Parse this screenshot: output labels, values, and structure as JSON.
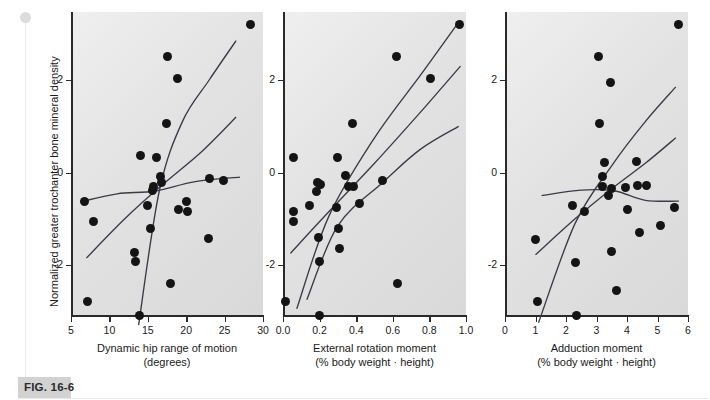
{
  "figure": {
    "caption_label": "FIG. 16-6",
    "shared_ylabel": "Normalized greater trochanter bone mineral density",
    "y_ticks": [
      "2",
      "0",
      "-2"
    ],
    "dot_color": "#141414",
    "curve_color": "#3b3b46",
    "panel_bg": "#e2e2e2"
  },
  "chart_data": [
    {
      "type": "scatter",
      "title": "",
      "xlabel": "Dynamic hip range of motion (degrees)",
      "xlabel_line1": "Dynamic hip range of motion",
      "xlabel_line2": "(degrees)",
      "ylabel": "Normalized greater trochanter bone mineral density",
      "xlim": [
        5,
        30
      ],
      "ylim": [
        -3.6,
        3.4
      ],
      "xticks": [
        5,
        10,
        15,
        20,
        25,
        30
      ],
      "xtick_labels": [
        "5",
        "10",
        "15",
        "20",
        "25",
        "30"
      ],
      "yticks": [
        2,
        0,
        -2
      ],
      "ytick_labels": [
        "2",
        "0",
        "-2"
      ],
      "grid": false,
      "legend": "none",
      "points": [
        [
          6.7,
          -0.62
        ],
        [
          7.1,
          -2.78
        ],
        [
          7.9,
          -1.05
        ],
        [
          13.3,
          -1.72
        ],
        [
          13.4,
          -1.92
        ],
        [
          13.9,
          -3.1
        ],
        [
          14.1,
          0.36
        ],
        [
          14.9,
          -0.72
        ],
        [
          15.3,
          -1.2
        ],
        [
          15.6,
          -0.38
        ],
        [
          15.8,
          -0.3
        ],
        [
          16.1,
          0.33
        ],
        [
          16.6,
          -0.08
        ],
        [
          16.8,
          -0.22
        ],
        [
          17.4,
          1.05
        ],
        [
          17.6,
          2.5
        ],
        [
          18.0,
          -2.4
        ],
        [
          18.9,
          2.04
        ],
        [
          19.0,
          -0.8
        ],
        [
          20.0,
          -0.62
        ],
        [
          20.2,
          -0.85
        ],
        [
          22.9,
          -1.42
        ],
        [
          23.0,
          -0.12
        ],
        [
          24.8,
          -0.18
        ],
        [
          28.4,
          3.2
        ]
      ],
      "curves": {
        "description": "regression fit with upper and lower confidence bands",
        "fit": [
          [
            7.0,
            -1.85
          ],
          [
            12.0,
            -1.0
          ],
          [
            17.0,
            -0.25
          ],
          [
            22.0,
            0.45
          ],
          [
            26.5,
            1.2
          ]
        ],
        "upper": [
          [
            13.8,
            -3.3
          ],
          [
            16.5,
            -0.4
          ],
          [
            19.5,
            1.1
          ],
          [
            23.0,
            2.0
          ],
          [
            26.5,
            2.85
          ]
        ],
        "lower": [
          [
            6.6,
            -0.62
          ],
          [
            11.0,
            -0.46
          ],
          [
            16.0,
            -0.4
          ],
          [
            21.0,
            -0.2
          ],
          [
            27.0,
            -0.1
          ]
        ]
      }
    },
    {
      "type": "scatter",
      "title": "",
      "xlabel": "External rotation moment (% body weight · height)",
      "xlabel_line1": "External rotation moment",
      "xlabel_line2": "(% body weight · height)",
      "ylabel": "Normalized greater trochanter bone mineral density",
      "xlim": [
        0.0,
        1.0
      ],
      "ylim": [
        -3.6,
        3.4
      ],
      "xticks": [
        0.0,
        0.2,
        0.4,
        0.6,
        0.8,
        1.0
      ],
      "xtick_labels": [
        "0.0",
        "0.2",
        "0.4",
        "0.6",
        "0.8",
        "1.0"
      ],
      "yticks": [
        2,
        0,
        -2
      ],
      "ytick_labels": [
        "2",
        "0",
        "-2"
      ],
      "grid": false,
      "legend": "none",
      "points": [
        [
          0.015,
          -2.78
        ],
        [
          0.055,
          0.32
        ],
        [
          0.06,
          -0.85
        ],
        [
          0.06,
          -1.05
        ],
        [
          0.145,
          -0.72
        ],
        [
          0.185,
          -0.42
        ],
        [
          0.19,
          -0.22
        ],
        [
          0.195,
          -1.4
        ],
        [
          0.2,
          -3.1
        ],
        [
          0.205,
          -0.25
        ],
        [
          0.2,
          -1.92
        ],
        [
          0.29,
          -0.75
        ],
        [
          0.3,
          0.33
        ],
        [
          0.305,
          -1.2
        ],
        [
          0.31,
          -1.65
        ],
        [
          0.34,
          -0.06
        ],
        [
          0.36,
          -0.3
        ],
        [
          0.38,
          1.05
        ],
        [
          0.385,
          -0.3
        ],
        [
          0.42,
          -0.68
        ],
        [
          0.545,
          -0.17
        ],
        [
          0.62,
          2.5
        ],
        [
          0.625,
          -2.4
        ],
        [
          0.805,
          2.04
        ],
        [
          0.965,
          3.2
        ]
      ],
      "curves": {
        "description": "regression fit with upper and lower confidence bands",
        "fit": [
          [
            0.04,
            -1.75
          ],
          [
            0.25,
            -0.85
          ],
          [
            0.5,
            0.2
          ],
          [
            0.75,
            1.3
          ],
          [
            0.97,
            2.3
          ]
        ],
        "upper": [
          [
            0.075,
            -2.95
          ],
          [
            0.25,
            -0.95
          ],
          [
            0.5,
            0.75
          ],
          [
            0.75,
            2.1
          ],
          [
            0.96,
            3.25
          ]
        ],
        "lower": [
          [
            0.13,
            -2.75
          ],
          [
            0.3,
            -1.15
          ],
          [
            0.55,
            -0.2
          ],
          [
            0.75,
            0.5
          ],
          [
            0.96,
            1.0
          ]
        ]
      }
    },
    {
      "type": "scatter",
      "title": "",
      "xlabel": "Adduction moment (% body weight · height)",
      "xlabel_line1": "Adduction moment",
      "xlabel_line2": "(% body weight · height)",
      "ylabel": "Normalized greater trochanter bone mineral density",
      "xlim": [
        0,
        6
      ],
      "ylim": [
        -3.6,
        3.4
      ],
      "xticks": [
        0,
        1,
        2,
        3,
        4,
        5,
        6
      ],
      "xtick_labels": [
        "0",
        "1",
        "2",
        "3",
        "4",
        "5",
        "6"
      ],
      "yticks": [
        2,
        0,
        -2
      ],
      "ytick_labels": [
        "2",
        "0",
        "-2"
      ],
      "grid": false,
      "legend": "none",
      "points": [
        [
          1.0,
          -1.45
        ],
        [
          1.05,
          -2.78
        ],
        [
          2.2,
          -0.72
        ],
        [
          2.3,
          -1.95
        ],
        [
          2.35,
          -3.1
        ],
        [
          2.6,
          -0.85
        ],
        [
          3.05,
          2.5
        ],
        [
          3.1,
          1.05
        ],
        [
          3.2,
          -0.08
        ],
        [
          3.2,
          -0.3
        ],
        [
          3.25,
          0.22
        ],
        [
          3.4,
          -0.5
        ],
        [
          3.45,
          1.95
        ],
        [
          3.5,
          -0.35
        ],
        [
          3.5,
          -1.7
        ],
        [
          3.65,
          -2.55
        ],
        [
          3.95,
          -0.33
        ],
        [
          4.0,
          -0.8
        ],
        [
          4.3,
          0.23
        ],
        [
          4.35,
          -0.28
        ],
        [
          4.4,
          -1.3
        ],
        [
          4.65,
          -0.28
        ],
        [
          5.1,
          -1.15
        ],
        [
          5.55,
          -0.75
        ],
        [
          5.7,
          3.2
        ]
      ],
      "curves": {
        "description": "regression fit with upper and lower confidence bands",
        "fit": [
          [
            1.0,
            -1.78
          ],
          [
            2.3,
            -1.0
          ],
          [
            3.5,
            -0.35
          ],
          [
            4.6,
            0.2
          ],
          [
            5.6,
            0.75
          ]
        ],
        "upper": [
          [
            1.1,
            -3.25
          ],
          [
            2.3,
            -1.1
          ],
          [
            3.5,
            0.15
          ],
          [
            4.6,
            1.1
          ],
          [
            5.6,
            1.85
          ]
        ],
        "lower": [
          [
            1.2,
            -0.5
          ],
          [
            2.5,
            -0.38
          ],
          [
            3.6,
            -0.4
          ],
          [
            4.6,
            -0.6
          ],
          [
            5.7,
            -0.62
          ]
        ]
      }
    }
  ]
}
